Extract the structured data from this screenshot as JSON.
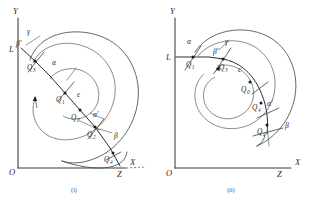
{
  "figure": {
    "type": "geometric-diagram-pair",
    "background_color": "#ffffff",
    "ink_color": "#2b2b2b"
  },
  "panels": [
    {
      "id": "panel-i",
      "caption": "(i)",
      "axes": {
        "origin_label": "O",
        "x_label": "X",
        "y_label": "Y"
      },
      "marks": [
        {
          "name": "point-L",
          "label": "L"
        },
        {
          "name": "point-Z",
          "label": "Z"
        }
      ],
      "points": [
        {
          "name": "point-Q3",
          "base": "Q",
          "sub": "3"
        },
        {
          "name": "point-Q1",
          "base": "Q",
          "sub": "1"
        },
        {
          "name": "point-Q0",
          "base": "Q",
          "sub": "0"
        },
        {
          "name": "point-Q2",
          "base": "Q",
          "sub": "2"
        },
        {
          "name": "point-Q4",
          "base": "Q",
          "sub": "4"
        }
      ],
      "angles": [
        {
          "name": "angle-gamma",
          "label": "γ"
        },
        {
          "name": "angle-beta-prime",
          "label": "β′"
        },
        {
          "name": "angle-alpha",
          "label": "α"
        },
        {
          "name": "angle-epsilon",
          "label": "ε"
        },
        {
          "name": "angle-alpha-prime",
          "label": "α′"
        },
        {
          "name": "angle-beta",
          "label": "β"
        }
      ]
    },
    {
      "id": "panel-ii",
      "caption": "(ii)",
      "axes": {
        "origin_label": "O",
        "x_label": "X",
        "y_label": "Y"
      },
      "marks": [
        {
          "name": "point-L",
          "label": "L"
        },
        {
          "name": "point-Z",
          "label": "Z"
        }
      ],
      "points": [
        {
          "name": "point-Q1",
          "base": "Q",
          "sub": "1"
        },
        {
          "name": "point-Q3",
          "base": "Q",
          "sub": "3"
        },
        {
          "name": "point-Q0",
          "base": "Q",
          "sub": "0"
        },
        {
          "name": "point-Q4",
          "base": "Q",
          "sub": "4"
        },
        {
          "name": "point-Q2",
          "base": "Q",
          "sub": "2"
        }
      ],
      "angles": [
        {
          "name": "angle-alpha",
          "label": "α"
        },
        {
          "name": "angle-beta-prime",
          "label": "β′"
        },
        {
          "name": "angle-gamma",
          "label": "γ"
        },
        {
          "name": "angle-epsilon",
          "label": "ε"
        },
        {
          "name": "angle-alpha-prime",
          "label": "α′"
        },
        {
          "name": "angle-beta",
          "label": "β"
        }
      ]
    }
  ]
}
